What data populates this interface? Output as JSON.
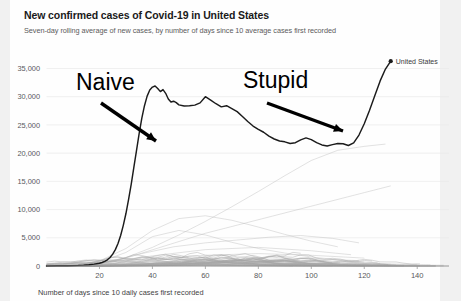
{
  "header": {
    "title": "New confirmed cases of Covid-19 in United States",
    "subtitle": "Seven-day rolling average of new cases, by number of days since 10 average cases first recorded"
  },
  "legend": {
    "items": [
      {
        "label": "United States",
        "color": "#1b1b1b",
        "marker": "dot-marker"
      }
    ]
  },
  "annotations": [
    {
      "name": "naive",
      "text": "Naive",
      "x": 76,
      "y": 90
    },
    {
      "name": "stupid",
      "text": "Stupid",
      "x": 243,
      "y": 88
    }
  ],
  "colors": {
    "us_line": "#1b1b1b",
    "other_lines": "#b9b9b9",
    "gridline": "#e9e9e9",
    "axis": "#8d8d8d",
    "page_background": "#f1f1f1",
    "card_background": "#fefefe",
    "title_text": "#1a1a1a",
    "subtitle_text": "#5c5c5c"
  },
  "chart_data": {
    "type": "line",
    "title": "New confirmed cases of Covid-19 in United States",
    "subtitle": "Seven-day rolling average of new cases, by number of days since 10 average cases first recorded",
    "xlabel": "Number of days since 10 daily cases first recorded",
    "ylabel": "",
    "xlim": [
      0,
      152
    ],
    "ylim": [
      0,
      36500
    ],
    "grid": "horizontal",
    "legend_position": "top-right",
    "xticks": [
      20,
      40,
      60,
      80,
      100,
      120,
      140
    ],
    "xtick_labels": [
      "20",
      "40",
      "60",
      "80",
      "100",
      "120",
      "140"
    ],
    "yticks": [
      0,
      5000,
      10000,
      15000,
      20000,
      25000,
      30000,
      35000
    ],
    "ytick_labels": [
      "0",
      "5,000",
      "10,000",
      "15,000",
      "20,000",
      "25,000",
      "30,000",
      "35,000"
    ],
    "highlight_series": "United States",
    "series": [
      {
        "name": "United States",
        "color": "#1b1b1b",
        "emphasis": true,
        "end_marker": true,
        "x": [
          0,
          4,
          8,
          12,
          14,
          16,
          18,
          20,
          21,
          22,
          23,
          24,
          25,
          26,
          27,
          28,
          29,
          30,
          31,
          32,
          33,
          34,
          35,
          36,
          37,
          38,
          39,
          40,
          41,
          42,
          43,
          44,
          45,
          46,
          47,
          48,
          49,
          50,
          52,
          54,
          56,
          58,
          60,
          62,
          64,
          66,
          68,
          70,
          72,
          74,
          76,
          78,
          80,
          82,
          84,
          86,
          88,
          90,
          92,
          94,
          96,
          98,
          100,
          102,
          104,
          106,
          108,
          110,
          112,
          114,
          116,
          118,
          120,
          122,
          124,
          126,
          128,
          130
        ],
        "y": [
          10,
          30,
          60,
          110,
          160,
          230,
          330,
          480,
          620,
          820,
          1100,
          1500,
          2100,
          2900,
          4000,
          5400,
          7200,
          9300,
          11800,
          14500,
          17500,
          20500,
          23500,
          26200,
          28400,
          30100,
          31200,
          31700,
          31900,
          31450,
          30900,
          31250,
          30600,
          29600,
          29050,
          29200,
          28950,
          28550,
          28350,
          28400,
          28500,
          28900,
          30000,
          29400,
          28750,
          28200,
          28400,
          27900,
          27350,
          26500,
          25600,
          24800,
          24200,
          23700,
          23000,
          22500,
          22150,
          22000,
          21700,
          21850,
          22350,
          22700,
          22400,
          21850,
          21450,
          21250,
          21500,
          21700,
          21650,
          21350,
          21800,
          23200,
          25200,
          27600,
          30200,
          32800,
          34900,
          36300
        ]
      },
      {
        "name": "other-country-1",
        "color": "#b9b9b9",
        "emphasis": false,
        "x": [
          0,
          10,
          20,
          30,
          40,
          50,
          60,
          70,
          80,
          90,
          100,
          110,
          120
        ],
        "y": [
          20,
          120,
          700,
          2400,
          5200,
          6300,
          5500,
          4200,
          3100,
          2300,
          1600,
          1100,
          700
        ]
      },
      {
        "name": "other-country-2",
        "color": "#b9b9b9",
        "emphasis": false,
        "x": [
          0,
          10,
          20,
          30,
          40,
          50,
          60,
          70,
          80,
          90,
          100,
          110,
          120,
          128
        ],
        "y": [
          15,
          90,
          420,
          1500,
          3300,
          5500,
          7900,
          10500,
          13200,
          16000,
          18700,
          20500,
          21200,
          21600
        ]
      },
      {
        "name": "other-country-3",
        "color": "#b9b9b9",
        "emphasis": false,
        "x": [
          0,
          10,
          20,
          30,
          40,
          50,
          60,
          70,
          80,
          90,
          100,
          110
        ],
        "y": [
          18,
          150,
          900,
          3100,
          6300,
          8400,
          8900,
          8100,
          6900,
          5600,
          4400,
          3400
        ]
      },
      {
        "name": "other-country-4",
        "color": "#b9b9b9",
        "emphasis": false,
        "x": [
          0,
          15,
          30,
          45,
          60,
          75,
          90,
          105,
          120,
          130
        ],
        "y": [
          12,
          200,
          1400,
          3600,
          5800,
          7600,
          9400,
          11200,
          13000,
          14200
        ]
      },
      {
        "name": "other-country-5",
        "color": "#b9b9b9",
        "emphasis": false,
        "x": [
          0,
          12,
          24,
          36,
          48,
          60,
          72,
          84,
          96,
          108,
          118
        ],
        "y": [
          10,
          130,
          800,
          2200,
          3400,
          4100,
          4600,
          5100,
          5400,
          4900,
          4100
        ]
      },
      {
        "name": "other-country-6",
        "color": "#b9b9b9",
        "emphasis": false,
        "x": [
          0,
          20,
          40,
          60,
          80,
          100,
          115
        ],
        "y": [
          8,
          400,
          1800,
          2900,
          3300,
          2700,
          2000
        ]
      },
      {
        "name": "other-country-7",
        "color": "#b9b9b9",
        "emphasis": false,
        "x": [
          0,
          20,
          40,
          60,
          80,
          100,
          120
        ],
        "y": [
          6,
          250,
          1200,
          1900,
          2200,
          1900,
          1400
        ]
      },
      {
        "name": "other-country-8",
        "color": "#b9b9b9",
        "emphasis": false,
        "x": [
          0,
          25,
          50,
          75,
          100,
          118
        ],
        "y": [
          5,
          300,
          900,
          1500,
          1300,
          950
        ]
      },
      {
        "name": "other-country-9",
        "color": "#b9b9b9",
        "emphasis": false,
        "x": [
          0,
          25,
          50,
          75,
          100,
          125
        ],
        "y": [
          4,
          180,
          600,
          1000,
          900,
          650
        ]
      },
      {
        "name": "other-country-10",
        "color": "#b9b9b9",
        "emphasis": false,
        "x": [
          0,
          30,
          60,
          90,
          110
        ],
        "y": [
          3,
          220,
          520,
          760,
          600
        ]
      },
      {
        "name": "other-country-11",
        "color": "#b9b9b9",
        "emphasis": false,
        "x": [
          0,
          30,
          60,
          90,
          120,
          140
        ],
        "y": [
          3,
          120,
          320,
          480,
          420,
          300
        ]
      },
      {
        "name": "other-country-12",
        "color": "#b9b9b9",
        "emphasis": false,
        "x": [
          0,
          35,
          70,
          105,
          130
        ],
        "y": [
          2,
          100,
          260,
          380,
          330
        ]
      },
      {
        "name": "other-country-13",
        "color": "#b9b9b9",
        "emphasis": false,
        "x": [
          0,
          40,
          80,
          120,
          145
        ],
        "y": [
          2,
          80,
          200,
          260,
          210
        ]
      },
      {
        "name": "other-country-14",
        "color": "#b9b9b9",
        "emphasis": false,
        "x": [
          0,
          40,
          80,
          120,
          150
        ],
        "y": [
          1,
          60,
          150,
          190,
          140
        ]
      },
      {
        "name": "other-country-15",
        "color": "#b9b9b9",
        "emphasis": false,
        "x": [
          0,
          45,
          90,
          130
        ],
        "y": [
          1,
          45,
          110,
          130
        ]
      }
    ]
  }
}
